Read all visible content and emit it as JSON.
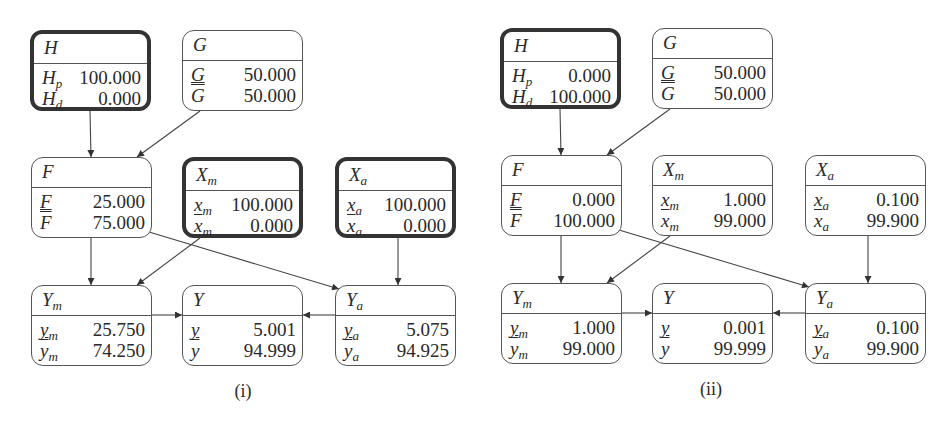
{
  "panels": [
    {
      "id": "i",
      "caption": "(i)",
      "nodes": {
        "H": {
          "title": "H",
          "title_sub": "",
          "evidence": true,
          "rows": [
            {
              "label": "H",
              "sub": "p",
              "mark": "",
              "value": "100.000"
            },
            {
              "label": "H",
              "sub": "d",
              "mark": "",
              "value": "0.000"
            }
          ]
        },
        "G": {
          "title": "G",
          "title_sub": "",
          "evidence": false,
          "rows": [
            {
              "label": "G",
              "sub": "",
              "mark": "underline",
              "value": "50.000"
            },
            {
              "label": "G",
              "sub": "",
              "mark": "overline",
              "value": "50.000"
            }
          ]
        },
        "F": {
          "title": "F",
          "title_sub": "",
          "evidence": false,
          "rows": [
            {
              "label": "F",
              "sub": "",
              "mark": "underline",
              "value": "25.000"
            },
            {
              "label": "F",
              "sub": "",
              "mark": "overline",
              "value": "75.000"
            }
          ]
        },
        "Xm": {
          "title": "X",
          "title_sub": "m",
          "evidence": true,
          "rows": [
            {
              "label": "x",
              "sub": "m",
              "mark": "",
              "value": "100.000"
            },
            {
              "label": "x",
              "sub": "m",
              "mark": "overline",
              "value": "0.000"
            }
          ]
        },
        "Xa": {
          "title": "X",
          "title_sub": "a",
          "evidence": true,
          "rows": [
            {
              "label": "x",
              "sub": "a",
              "mark": "",
              "value": "100.000"
            },
            {
              "label": "x",
              "sub": "a",
              "mark": "overline",
              "value": "0.000"
            }
          ]
        },
        "Ym": {
          "title": "Y",
          "title_sub": "m",
          "evidence": false,
          "rows": [
            {
              "label": "y",
              "sub": "m",
              "mark": "underline",
              "value": "25.750"
            },
            {
              "label": "y",
              "sub": "m",
              "mark": "overline",
              "value": "74.250"
            }
          ]
        },
        "Y": {
          "title": "Y",
          "title_sub": "",
          "evidence": false,
          "rows": [
            {
              "label": "y",
              "sub": "",
              "mark": "underline",
              "value": "5.001"
            },
            {
              "label": "y",
              "sub": "",
              "mark": "overline",
              "value": "94.999"
            }
          ]
        },
        "Ya": {
          "title": "Y",
          "title_sub": "a",
          "evidence": false,
          "rows": [
            {
              "label": "y",
              "sub": "a",
              "mark": "underline",
              "value": "5.075"
            },
            {
              "label": "y",
              "sub": "a",
              "mark": "overline",
              "value": "94.925"
            }
          ]
        }
      }
    },
    {
      "id": "ii",
      "caption": "(ii)",
      "nodes": {
        "H": {
          "title": "H",
          "title_sub": "",
          "evidence": true,
          "rows": [
            {
              "label": "H",
              "sub": "p",
              "mark": "",
              "value": "0.000"
            },
            {
              "label": "H",
              "sub": "d",
              "mark": "",
              "value": "100.000"
            }
          ]
        },
        "G": {
          "title": "G",
          "title_sub": "",
          "evidence": false,
          "rows": [
            {
              "label": "G",
              "sub": "",
              "mark": "underline",
              "value": "50.000"
            },
            {
              "label": "G",
              "sub": "",
              "mark": "overline",
              "value": "50.000"
            }
          ]
        },
        "F": {
          "title": "F",
          "title_sub": "",
          "evidence": false,
          "rows": [
            {
              "label": "F",
              "sub": "",
              "mark": "underline",
              "value": "0.000"
            },
            {
              "label": "F",
              "sub": "",
              "mark": "overline",
              "value": "100.000"
            }
          ]
        },
        "Xm": {
          "title": "X",
          "title_sub": "m",
          "evidence": false,
          "rows": [
            {
              "label": "x",
              "sub": "m",
              "mark": "",
              "value": "1.000"
            },
            {
              "label": "x",
              "sub": "m",
              "mark": "overline",
              "value": "99.000"
            }
          ]
        },
        "Xa": {
          "title": "X",
          "title_sub": "a",
          "evidence": false,
          "rows": [
            {
              "label": "x",
              "sub": "a",
              "mark": "",
              "value": "0.100"
            },
            {
              "label": "x",
              "sub": "a",
              "mark": "overline",
              "value": "99.900"
            }
          ]
        },
        "Ym": {
          "title": "Y",
          "title_sub": "m",
          "evidence": false,
          "rows": [
            {
              "label": "y",
              "sub": "m",
              "mark": "underline",
              "value": "1.000"
            },
            {
              "label": "y",
              "sub": "m",
              "mark": "overline",
              "value": "99.000"
            }
          ]
        },
        "Y": {
          "title": "Y",
          "title_sub": "",
          "evidence": false,
          "rows": [
            {
              "label": "y",
              "sub": "",
              "mark": "underline",
              "value": "0.001"
            },
            {
              "label": "y",
              "sub": "",
              "mark": "overline",
              "value": "99.999"
            }
          ]
        },
        "Ya": {
          "title": "Y",
          "title_sub": "a",
          "evidence": false,
          "rows": [
            {
              "label": "y",
              "sub": "a",
              "mark": "underline",
              "value": "0.100"
            },
            {
              "label": "y",
              "sub": "a",
              "mark": "overline",
              "value": "99.900"
            }
          ]
        }
      }
    }
  ],
  "edges": [
    {
      "from": "H",
      "to": "F"
    },
    {
      "from": "G",
      "to": "F"
    },
    {
      "from": "F",
      "to": "Ym"
    },
    {
      "from": "F",
      "to": "Ya"
    },
    {
      "from": "Xm",
      "to": "Ym"
    },
    {
      "from": "Xa",
      "to": "Ya"
    },
    {
      "from": "Ym",
      "to": "Y"
    },
    {
      "from": "Ya",
      "to": "Y"
    }
  ]
}
